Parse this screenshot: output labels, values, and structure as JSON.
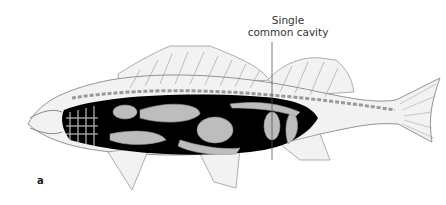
{
  "figure": {
    "panel_label": "a",
    "annotations": [
      {
        "id": "single-common-cavity",
        "lines": [
          "Single",
          "common cavity"
        ]
      }
    ],
    "colors": {
      "body_fill": "#f2f2f2",
      "outline": "#888888",
      "cavity_fill": "#000000",
      "organ_fill": "#bdbdbd",
      "label_text": "#333333"
    }
  }
}
